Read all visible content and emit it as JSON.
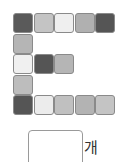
{
  "figure": {
    "cells": [
      {
        "row": 0,
        "col": 0,
        "color": "#5a5a5a"
      },
      {
        "row": 0,
        "col": 1,
        "color": "#c4c4c4"
      },
      {
        "row": 0,
        "col": 2,
        "color": "#efefef"
      },
      {
        "row": 0,
        "col": 3,
        "color": "#b0b0b0"
      },
      {
        "row": 0,
        "col": 4,
        "color": "#555555"
      },
      {
        "row": 1,
        "col": 0,
        "color": "#b5b5b5"
      },
      {
        "row": 2,
        "col": 0,
        "color": "#f0f0f0"
      },
      {
        "row": 2,
        "col": 1,
        "color": "#555555"
      },
      {
        "row": 2,
        "col": 2,
        "color": "#b5b5b5"
      },
      {
        "row": 3,
        "col": 0,
        "color": "#bdbdbd"
      },
      {
        "row": 4,
        "col": 0,
        "color": "#555555"
      },
      {
        "row": 4,
        "col": 1,
        "color": "#ececec"
      },
      {
        "row": 4,
        "col": 2,
        "color": "#c0c0c0"
      },
      {
        "row": 4,
        "col": 3,
        "color": "#b3b3b3"
      },
      {
        "row": 4,
        "col": 4,
        "color": "#c4c4c4"
      }
    ]
  },
  "answer": {
    "value": "",
    "unit": "개"
  }
}
